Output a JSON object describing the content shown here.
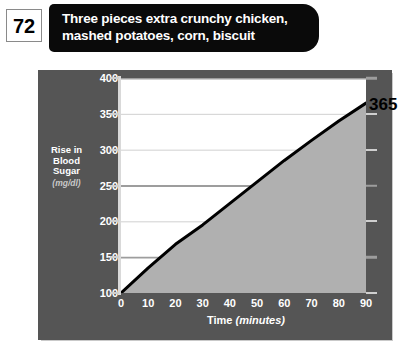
{
  "page_number": "72",
  "title": {
    "line1": "Three pieces extra crunchy chicken,",
    "line2": "mashed potatoes, corn, biscuit"
  },
  "value_callout": "365",
  "colors": {
    "panel": "#555555",
    "title_bar": "#0a0a0a",
    "plot_bg": "#ffffff",
    "area_fill": "#b0b0b0",
    "curve": "#000000",
    "gridline": "#d0d0d0",
    "gridline_major": "#9d9d9d"
  },
  "chart_data": {
    "type": "area",
    "title": "Three pieces extra crunchy chicken, mashed potatoes, corn, biscuit",
    "xlabel_text": "Time",
    "xlabel_unit": "(minutes)",
    "ylabel_text": "Rise in Blood Sugar",
    "ylabel_unit": "(mg/dl)",
    "ylabel_lines": [
      "Rise in",
      "Blood",
      "Sugar"
    ],
    "x": [
      0,
      10,
      20,
      30,
      40,
      50,
      60,
      70,
      80,
      90
    ],
    "values": [
      100,
      135,
      168,
      195,
      225,
      255,
      285,
      313,
      340,
      365
    ],
    "xticks": [
      0,
      10,
      20,
      30,
      40,
      50,
      60,
      70,
      80,
      90
    ],
    "yticks": [
      100,
      150,
      200,
      250,
      300,
      350,
      400
    ],
    "major_yticks": [
      150,
      250,
      400
    ],
    "xlim": [
      0,
      90
    ],
    "ylim": [
      100,
      400
    ],
    "grid": true,
    "legend": "none",
    "annotations": [
      {
        "text": "365",
        "x": 90,
        "y": 365
      }
    ]
  }
}
